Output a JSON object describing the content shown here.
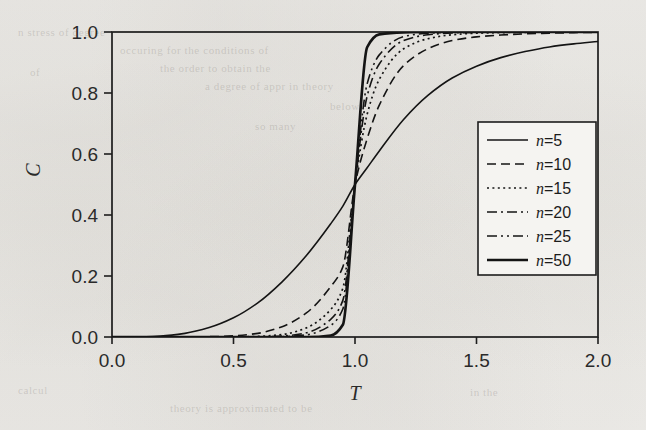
{
  "chart_data": {
    "type": "line",
    "title": "",
    "xlabel": "T",
    "ylabel": "C",
    "xlim": [
      0.0,
      2.0
    ],
    "ylim": [
      0.0,
      1.0
    ],
    "grid": false,
    "legend_position": "center-right",
    "xticks": [
      "0.0",
      "0.5",
      "1.0",
      "1.5",
      "2.0"
    ],
    "xtick_values": [
      0.0,
      0.5,
      1.0,
      1.5,
      2.0
    ],
    "yticks": [
      "0.0",
      "0.2",
      "0.4",
      "0.6",
      "0.8",
      "1.0"
    ],
    "ytick_values": [
      0.0,
      0.2,
      0.4,
      0.6,
      0.8,
      1.0
    ],
    "crossing_point": {
      "x": 1.0,
      "y": 0.5
    },
    "x": [
      0.0,
      0.1,
      0.2,
      0.3,
      0.4,
      0.5,
      0.6,
      0.7,
      0.8,
      0.9,
      0.95,
      1.0,
      1.05,
      1.1,
      1.2,
      1.3,
      1.4,
      1.5,
      1.6,
      1.7,
      1.8,
      1.9,
      2.0
    ],
    "series": [
      {
        "name": "n=5",
        "n": 5,
        "style": "solid",
        "width": 1.6,
        "legend_label_prefix": "n",
        "legend_label_value": "=5",
        "values": [
          0.0,
          0.0,
          0.003,
          0.012,
          0.031,
          0.063,
          0.112,
          0.181,
          0.267,
          0.371,
          0.429,
          0.5,
          0.555,
          0.61,
          0.713,
          0.792,
          0.849,
          0.888,
          0.916,
          0.936,
          0.951,
          0.961,
          0.969
        ]
      },
      {
        "name": "n=10",
        "n": 10,
        "style": "dashed",
        "width": 1.6,
        "legend_label_prefix": "n",
        "legend_label_value": "=10",
        "values": [
          0.0,
          0.0,
          0.0,
          0.0,
          0.001,
          0.004,
          0.012,
          0.034,
          0.079,
          0.165,
          0.23,
          0.5,
          0.65,
          0.76,
          0.89,
          0.945,
          0.972,
          0.984,
          0.99,
          0.994,
          0.996,
          0.998,
          0.999
        ]
      },
      {
        "name": "n=15",
        "n": 15,
        "style": "dotted",
        "width": 1.7,
        "legend_label_prefix": "n",
        "legend_label_value": "=15",
        "values": [
          0.0,
          0.0,
          0.0,
          0.0,
          0.0,
          0.0,
          0.002,
          0.008,
          0.03,
          0.09,
          0.16,
          0.5,
          0.73,
          0.845,
          0.945,
          0.978,
          0.991,
          0.996,
          0.998,
          0.999,
          1.0,
          1.0,
          1.0
        ]
      },
      {
        "name": "n=20",
        "n": 20,
        "style": "dash-dot",
        "width": 1.6,
        "legend_label_prefix": "n",
        "legend_label_value": "=20",
        "values": [
          0.0,
          0.0,
          0.0,
          0.0,
          0.0,
          0.0,
          0.0,
          0.003,
          0.014,
          0.058,
          0.12,
          0.5,
          0.79,
          0.895,
          0.972,
          0.991,
          0.997,
          0.999,
          1.0,
          1.0,
          1.0,
          1.0,
          1.0
        ]
      },
      {
        "name": "n=25",
        "n": 25,
        "style": "dash-dot-dot",
        "width": 1.6,
        "legend_label_prefix": "n",
        "legend_label_value": "=25",
        "values": [
          0.0,
          0.0,
          0.0,
          0.0,
          0.0,
          0.0,
          0.0,
          0.001,
          0.007,
          0.038,
          0.092,
          0.5,
          0.83,
          0.925,
          0.985,
          0.996,
          0.999,
          1.0,
          1.0,
          1.0,
          1.0,
          1.0,
          1.0
        ]
      },
      {
        "name": "n=50",
        "n": 50,
        "style": "solid",
        "width": 2.7,
        "legend_label_prefix": "n",
        "legend_label_value": "=50",
        "values": [
          0.0,
          0.0,
          0.0,
          0.0,
          0.0,
          0.0,
          0.0,
          0.0,
          0.0,
          0.005,
          0.04,
          0.5,
          0.95,
          0.992,
          0.999,
          1.0,
          1.0,
          1.0,
          1.0,
          1.0,
          1.0,
          1.0,
          1.0
        ]
      }
    ]
  },
  "ghost_text": [
    {
      "t": "n stress of degree",
      "x": 18,
      "y": 22
    },
    {
      "t": "occuring for the conditions of",
      "x": 120,
      "y": 40
    },
    {
      "t": "the order to obtain the",
      "x": 160,
      "y": 58
    },
    {
      "t": "a degree of appr in theory",
      "x": 205,
      "y": 76
    },
    {
      "t": "below",
      "x": 330,
      "y": 96
    },
    {
      "t": "so many",
      "x": 255,
      "y": 116
    },
    {
      "t": "of",
      "x": 30,
      "y": 62
    },
    {
      "t": "calcul",
      "x": 18,
      "y": 380
    },
    {
      "t": "theory is approximated to be",
      "x": 170,
      "y": 398
    },
    {
      "t": "in the",
      "x": 470,
      "y": 382
    }
  ]
}
